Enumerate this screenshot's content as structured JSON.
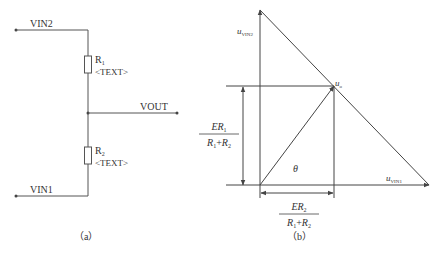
{
  "circuit": {
    "caption": "（a）",
    "nodes": {
      "vin2": "VIN2",
      "vin1": "VIN1",
      "vout": "VOUT"
    },
    "resistors": [
      {
        "name": "R",
        "sub": "1",
        "value": "<TEXT>"
      },
      {
        "name": "R",
        "sub": "2",
        "value": "<TEXT>"
      }
    ]
  },
  "vector_diagram": {
    "caption": "（b）",
    "axis_vertical_label": {
      "base": "u",
      "sub": "VIN2"
    },
    "axis_horizontal_label": {
      "base": "u",
      "sub": "VIN1"
    },
    "point_label": {
      "base": "u",
      "sub": "o"
    },
    "angle_label": "θ",
    "vertical_dim": {
      "numerator": "ER",
      "num_sub": "1",
      "denominator": "R",
      "den_a": "1",
      "plus": "+",
      "den_b_base": "R",
      "den_b": "2"
    },
    "horizontal_dim": {
      "numerator": "ER",
      "num_sub": "2",
      "denominator": "R",
      "den_a": "1",
      "plus": "+",
      "den_b_base": "R",
      "den_b": "2"
    }
  }
}
